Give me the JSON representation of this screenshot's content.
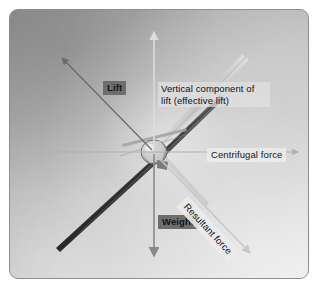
{
  "figure": {
    "panel_bg_light": "#ececec",
    "panel_bg_dark": "#9c9c9c",
    "label_dark_bg": "#6e6e6e",
    "label_light_bg": "#ececec"
  },
  "labels": {
    "lift": "Lift",
    "vertical_component": "Vertical component of lift (effective lift)",
    "centrifugal": "Centrifugal force",
    "weight": "Weight",
    "resultant": "Resultant force"
  },
  "vectors": [
    {
      "name": "lift",
      "label": "Lift",
      "direction": "up-left",
      "color": "#6b6b6b"
    },
    {
      "name": "vertical-component",
      "label": "Vertical component of lift (effective lift)",
      "direction": "up",
      "color": "#d6d6d6"
    },
    {
      "name": "centrifugal",
      "label": "Centrifugal force",
      "direction": "right",
      "color": "#b9b9b9"
    },
    {
      "name": "weight",
      "label": "Weight",
      "direction": "down",
      "color": "#8a8a8a"
    },
    {
      "name": "resultant",
      "label": "Resultant force",
      "direction": "down-right",
      "color": "#c8c8c8"
    }
  ]
}
